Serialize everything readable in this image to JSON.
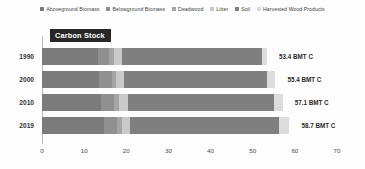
{
  "chart_data": {
    "type": "bar",
    "orientation": "horizontal",
    "stacked": true,
    "title": "Carbon Stock",
    "xlabel": "",
    "ylabel": "",
    "xlim": [
      0,
      70
    ],
    "xticks": [
      0,
      10,
      20,
      30,
      40,
      50,
      60,
      70
    ],
    "grid": false,
    "legend_position": "top",
    "value_unit": "BMT C",
    "categories": [
      "1990",
      "2000",
      "2010",
      "2019"
    ],
    "series": [
      {
        "name": "Aboveground Biomass",
        "color": "#7b7b7b",
        "values": [
          13.2,
          13.6,
          14.1,
          14.6
        ]
      },
      {
        "name": "Belowground Biomass",
        "color": "#8f8f8f",
        "values": [
          2.8,
          2.9,
          3.0,
          3.1
        ]
      },
      {
        "name": "Deadwood",
        "color": "#a5a5a5",
        "values": [
          1.0,
          1.1,
          1.2,
          1.3
        ]
      },
      {
        "name": "Litter",
        "color": "#c9c9c9",
        "values": [
          1.9,
          1.9,
          2.0,
          2.0
        ]
      },
      {
        "name": "Soil",
        "color": "#7f7f7f",
        "values": [
          33.4,
          34.0,
          34.8,
          35.2
        ]
      },
      {
        "name": "Harvested Wood Products",
        "color": "#dcdcdc",
        "values": [
          1.1,
          1.9,
          2.0,
          2.5
        ]
      }
    ],
    "bar_totals": [
      "53.4 BMT C",
      "55.4 BMT C",
      "57.1 BMT C",
      "58.7 BMT C"
    ],
    "totals": [
      53.4,
      55.4,
      57.1,
      58.7
    ]
  },
  "axis": {
    "tick_labels": [
      "0",
      "10",
      "20",
      "30",
      "40",
      "50",
      "60",
      "70"
    ],
    "year_labels": [
      "1990",
      "2000",
      "2010",
      "2019"
    ]
  },
  "colors": {
    "axis_line": "#b9b9b9",
    "title_bg": "#272727",
    "title_fg": "#ffffff",
    "background": "#fdfdfd"
  }
}
